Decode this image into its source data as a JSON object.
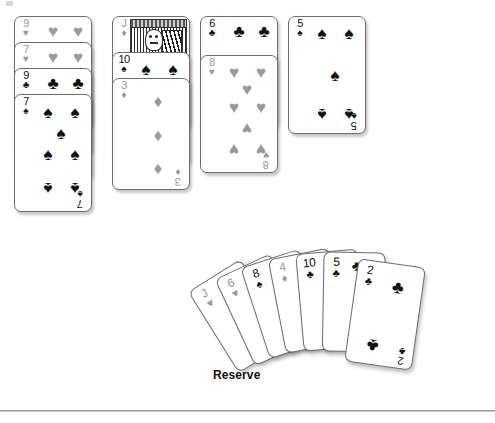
{
  "screen": {
    "title": "Solitaire Tableau and Reserve",
    "background_color": "#ffffff",
    "rule_color": "#9b9b9b"
  },
  "labels": {
    "reserve": "Reserve"
  },
  "suits": {
    "spade": "♠",
    "heart": "♥",
    "club": "♣",
    "diamond": "♦"
  },
  "colors": {
    "black_suit": "#111111",
    "red_suit_rendered": "#9a9a9a",
    "card_face": "#ffffff",
    "card_border": "#6d6d6d"
  },
  "tableau": {
    "columns": [
      {
        "name": "column-1",
        "cards": [
          {
            "rank": "9",
            "suit": "♥",
            "suit_name": "heart",
            "color": "grey"
          },
          {
            "rank": "7",
            "suit": "♥",
            "suit_name": "heart",
            "color": "grey"
          },
          {
            "rank": "9",
            "suit": "♣",
            "suit_name": "club",
            "color": "black"
          },
          {
            "rank": "7",
            "suit": "♠",
            "suit_name": "spade",
            "color": "black"
          }
        ]
      },
      {
        "name": "column-2",
        "cards": [
          {
            "rank": "J",
            "suit": "♦",
            "suit_name": "diamond",
            "color": "grey"
          },
          {
            "rank": "10",
            "suit": "♠",
            "suit_name": "spade",
            "color": "black"
          },
          {
            "rank": "3",
            "suit": "♦",
            "suit_name": "diamond",
            "color": "grey"
          }
        ]
      },
      {
        "name": "column-3",
        "cards": [
          {
            "rank": "6",
            "suit": "♣",
            "suit_name": "club",
            "color": "black"
          },
          {
            "rank": "8",
            "suit": "♥",
            "suit_name": "heart",
            "color": "grey"
          }
        ]
      },
      {
        "name": "column-4",
        "cards": [
          {
            "rank": "5",
            "suit": "♠",
            "suit_name": "spade",
            "color": "black"
          }
        ]
      }
    ]
  },
  "reserve": {
    "label": "Reserve",
    "count": 7,
    "cards": [
      {
        "rank": "J",
        "suit": "♥",
        "suit_name": "heart",
        "color": "grey"
      },
      {
        "rank": "6",
        "suit": "♥",
        "suit_name": "heart",
        "color": "grey"
      },
      {
        "rank": "8",
        "suit": "♠",
        "suit_name": "spade",
        "color": "black"
      },
      {
        "rank": "4",
        "suit": "♦",
        "suit_name": "diamond",
        "color": "grey"
      },
      {
        "rank": "10",
        "suit": "♣",
        "suit_name": "club",
        "color": "black"
      },
      {
        "rank": "5",
        "suit": "♣",
        "suit_name": "club",
        "color": "black"
      },
      {
        "rank": "2",
        "suit": "♣",
        "suit_name": "club",
        "color": "black"
      }
    ]
  }
}
